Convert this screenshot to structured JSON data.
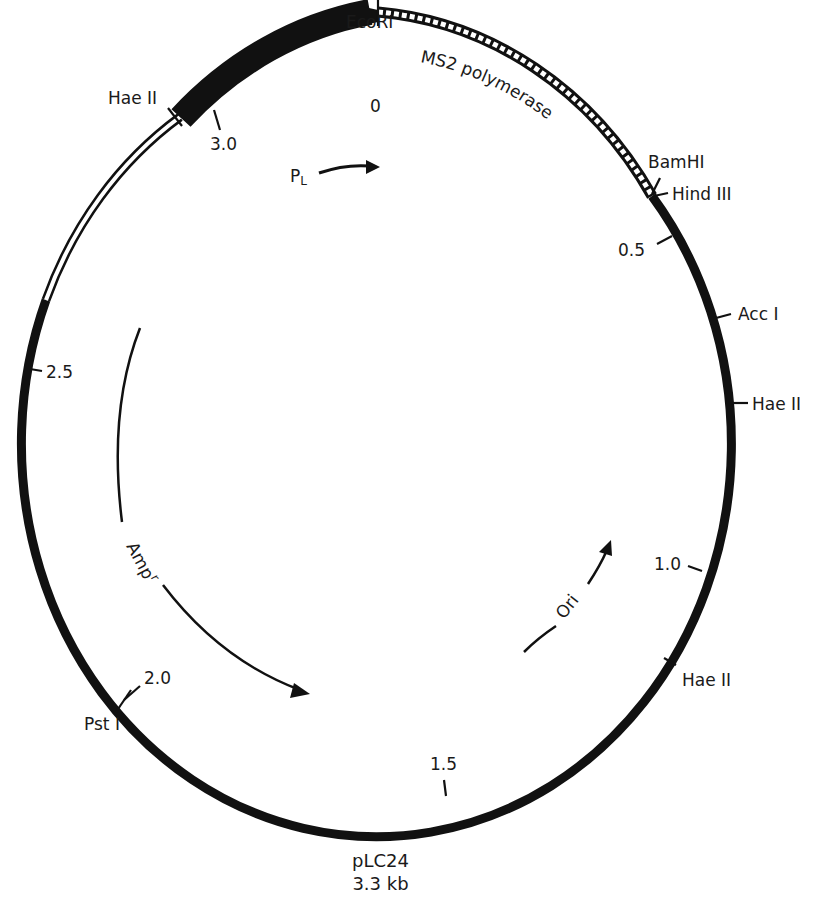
{
  "plasmid": {
    "name": "pLC24",
    "size": "3.3 kb",
    "total_kb": 3.3
  },
  "scale_marks": [
    {
      "label": "0",
      "kb": 0.0
    },
    {
      "label": "0.5",
      "kb": 0.5
    },
    {
      "label": "1.0",
      "kb": 1.0
    },
    {
      "label": "1.5",
      "kb": 1.5
    },
    {
      "label": "2.0",
      "kb": 2.0
    },
    {
      "label": "2.5",
      "kb": 2.5
    },
    {
      "label": "3.0",
      "kb": 3.0
    }
  ],
  "restriction_sites": [
    {
      "name": "EcoRI"
    },
    {
      "name": "BamHI"
    },
    {
      "name": "HindIII",
      "display": "Hind III"
    },
    {
      "name": "AccI",
      "display": "Acc I"
    },
    {
      "name": "HaeII",
      "display": "Hae II"
    },
    {
      "name": "HaeII",
      "display": "Hae II"
    },
    {
      "name": "PstI",
      "display": "Pst I"
    },
    {
      "name": "HaeII",
      "display": "Hae II"
    }
  ],
  "features": [
    {
      "name": "MS2 polymerase",
      "style": "hatched"
    },
    {
      "name": "PL",
      "style": "arrow",
      "display": "P",
      "subscript": "L"
    },
    {
      "name": "Ampr",
      "style": "arrow",
      "display": "Amp",
      "superscript": "r"
    },
    {
      "name": "Ori",
      "style": "arrow"
    },
    {
      "name": "lambda PL region",
      "style": "thick-black"
    },
    {
      "name": "open segment",
      "style": "double-line"
    }
  ]
}
